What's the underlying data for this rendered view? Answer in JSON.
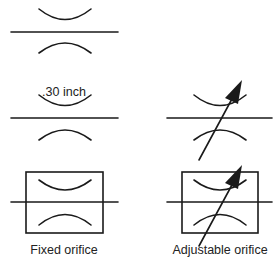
{
  "diagram": {
    "symbols": [
      {
        "name": "fixed-orifice-basic",
        "row": 1,
        "column": 1
      },
      {
        "name": "fixed-orifice-dimensioned",
        "row": 2,
        "column": 1,
        "annotation": ".30 inch"
      },
      {
        "name": "adjustable-orifice-basic",
        "row": 2,
        "column": 2
      },
      {
        "name": "fixed-orifice-boxed",
        "row": 3,
        "column": 1,
        "caption": "Fixed orifice"
      },
      {
        "name": "adjustable-orifice-boxed",
        "row": 3,
        "column": 2,
        "caption": "Adjustable orifice"
      }
    ],
    "labels": {
      "dimension": ".30 inch",
      "fixed_caption": "Fixed orifice",
      "adjustable_caption": "Adjustable orifice"
    },
    "colors": {
      "line": "#1a1a1a",
      "background": "#ffffff"
    }
  }
}
